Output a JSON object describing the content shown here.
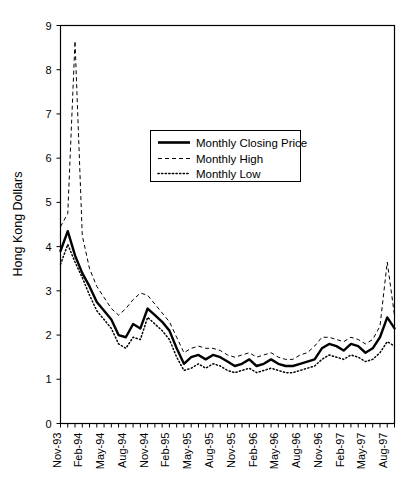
{
  "chart_data": {
    "type": "line",
    "title": "",
    "xlabel": "",
    "ylabel": "Hong Kong Dollars",
    "ylim": [
      0,
      9
    ],
    "yticks": [
      0,
      1,
      2,
      3,
      4,
      5,
      6,
      7,
      8,
      9
    ],
    "ytick_labels": [
      "0",
      "1",
      "2",
      "3",
      "4",
      "5",
      "6",
      "7",
      "8",
      "9"
    ],
    "grid": false,
    "legend_position": "upper center",
    "x": [
      "Nov-93",
      "Dec-93",
      "Jan-94",
      "Feb-94",
      "Mar-94",
      "Apr-94",
      "May-94",
      "Jun-94",
      "Jul-94",
      "Aug-94",
      "Sep-94",
      "Oct-94",
      "Nov-94",
      "Dec-94",
      "Jan-95",
      "Feb-95",
      "Mar-95",
      "Apr-95",
      "May-95",
      "Jun-95",
      "Jul-95",
      "Aug-95",
      "Sep-95",
      "Oct-95",
      "Nov-95",
      "Dec-95",
      "Jan-96",
      "Feb-96",
      "Mar-96",
      "Apr-96",
      "May-96",
      "Jun-96",
      "Jul-96",
      "Aug-96",
      "Sep-96",
      "Oct-96",
      "Nov-96",
      "Dec-96",
      "Jan-97",
      "Feb-97",
      "Mar-97",
      "Apr-97",
      "May-97",
      "Jun-97",
      "Jul-97",
      "Aug-97",
      "Sep-97"
    ],
    "xtick_labels": [
      "Nov-93",
      "Feb-94",
      "May-94",
      "Aug-94",
      "Nov-94",
      "Feb-95",
      "May-95",
      "Aug-95",
      "Nov-95",
      "Feb-96",
      "May-96",
      "Aug-96",
      "Nov-96",
      "Feb-97",
      "May-97",
      "Aug-97"
    ],
    "xtick_label_interval_months": 3,
    "minor_ticks_monthly": true,
    "series": [
      {
        "name": "Monthly Closing Price",
        "style": "solid",
        "color": "#000000",
        "values": [
          3.9,
          4.35,
          3.8,
          3.4,
          3.1,
          2.75,
          2.55,
          2.35,
          2.0,
          1.95,
          2.25,
          2.15,
          2.6,
          2.45,
          2.3,
          2.1,
          1.7,
          1.35,
          1.5,
          1.55,
          1.45,
          1.55,
          1.5,
          1.4,
          1.3,
          1.35,
          1.45,
          1.3,
          1.35,
          1.45,
          1.35,
          1.3,
          1.3,
          1.35,
          1.4,
          1.45,
          1.7,
          1.8,
          1.75,
          1.65,
          1.8,
          1.75,
          1.6,
          1.7,
          1.95,
          2.4,
          2.15
        ]
      },
      {
        "name": "Monthly High",
        "style": "dashed",
        "color": "#000000",
        "values": [
          4.45,
          4.75,
          8.65,
          4.25,
          3.5,
          3.1,
          2.85,
          2.6,
          2.45,
          2.6,
          2.8,
          2.95,
          2.9,
          2.7,
          2.5,
          2.3,
          1.95,
          1.6,
          1.7,
          1.75,
          1.7,
          1.7,
          1.65,
          1.55,
          1.5,
          1.55,
          1.6,
          1.5,
          1.55,
          1.6,
          1.5,
          1.45,
          1.45,
          1.55,
          1.6,
          1.75,
          1.95,
          1.95,
          1.9,
          1.85,
          1.95,
          1.9,
          1.8,
          1.9,
          2.2,
          3.65,
          2.45
        ]
      },
      {
        "name": "Monthly Low",
        "style": "dotted",
        "color": "#000000",
        "values": [
          3.6,
          4.05,
          3.65,
          3.3,
          2.9,
          2.55,
          2.35,
          2.15,
          1.8,
          1.7,
          1.95,
          1.9,
          2.4,
          2.25,
          2.1,
          1.9,
          1.5,
          1.2,
          1.25,
          1.35,
          1.25,
          1.35,
          1.3,
          1.2,
          1.15,
          1.2,
          1.25,
          1.15,
          1.2,
          1.25,
          1.2,
          1.15,
          1.15,
          1.2,
          1.25,
          1.3,
          1.45,
          1.55,
          1.5,
          1.45,
          1.55,
          1.5,
          1.4,
          1.45,
          1.6,
          1.85,
          1.75
        ]
      }
    ]
  },
  "legend": {
    "entries": [
      {
        "label": "Monthly Closing Price",
        "icon": "solid-line-swatch"
      },
      {
        "label": "Monthly High",
        "icon": "dashed-line-swatch"
      },
      {
        "label": "Monthly Low",
        "icon": "dotted-line-swatch"
      }
    ]
  },
  "axes": {
    "y_title": "Hong Kong Dollars"
  }
}
